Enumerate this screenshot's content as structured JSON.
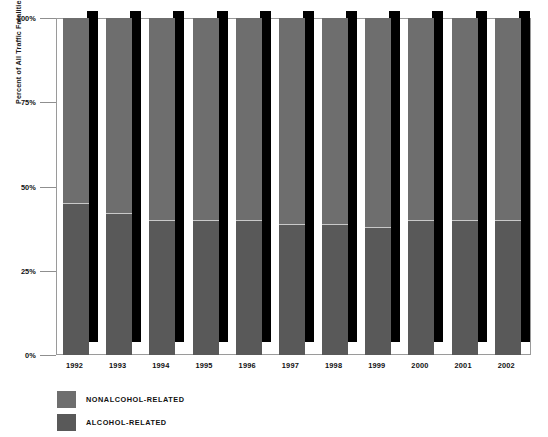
{
  "chart_data": {
    "type": "bar",
    "subtype": "stacked-column-100",
    "title": "",
    "xlabel": "",
    "ylabel": "Percent of All Traffic Fatalities",
    "categories": [
      "1992",
      "1993",
      "1994",
      "1995",
      "1996",
      "1997",
      "1998",
      "1999",
      "2000",
      "2001",
      "2002"
    ],
    "series": [
      {
        "name": "NONALCOHOL-RELATED",
        "color": "#6e6e6e",
        "values": [
          55,
          58,
          60,
          60,
          60,
          61,
          61,
          62,
          60,
          60,
          60
        ]
      },
      {
        "name": "ALCOHOL-RELATED",
        "color": "#595959",
        "values": [
          45,
          42,
          40,
          40,
          40,
          39,
          39,
          38,
          40,
          40,
          40
        ]
      }
    ],
    "ylim": [
      0,
      100
    ],
    "ytick_values": [
      0,
      25,
      50,
      75,
      100
    ],
    "ytick_labels": [
      "0%",
      "25%",
      "50%",
      "75%",
      "100%"
    ],
    "grid": false,
    "legend_position": "bottom-left"
  },
  "axis": {
    "y_title": "Percent of All Traffic Fatalities",
    "ticks": [
      {
        "label": "100%",
        "value": 100
      },
      {
        "label": "75%",
        "value": 75
      },
      {
        "label": "50%",
        "value": 50
      },
      {
        "label": "25%",
        "value": 25
      },
      {
        "label": "0%",
        "value": 0
      }
    ]
  },
  "legend": {
    "items": [
      {
        "label": "NONALCOHOL-RELATED",
        "color": "#6e6e6e"
      },
      {
        "label": "ALCOHOL-RELATED",
        "color": "#595959"
      }
    ]
  }
}
